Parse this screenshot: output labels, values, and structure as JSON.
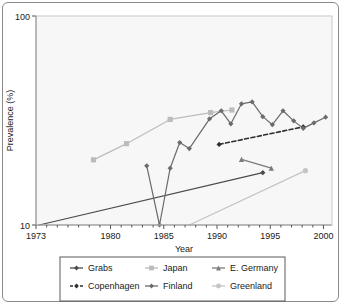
{
  "chart_data": {
    "type": "line",
    "title": "",
    "xlabel": "Year",
    "ylabel": "Prevalence (%)",
    "xlim": [
      1973,
      2000.8
    ],
    "ylim": [
      10,
      100
    ],
    "yscale": "log",
    "xscale": "linear",
    "grid": false,
    "legend_position": "bottom",
    "x_ticks": [
      1973,
      1980,
      1985,
      1990,
      1995,
      2000
    ],
    "x_tick_labels": [
      "1973",
      "1980",
      "1985",
      "1990",
      "1995",
      "2000"
    ],
    "y_ticks": [
      10,
      100
    ],
    "y_tick_labels": [
      "10",
      "100"
    ],
    "series": [
      {
        "name": "Grabs",
        "color": "#4a4a4a",
        "marker": "diamond",
        "dash": "none",
        "x": [
          1973.3,
          1994.3
        ],
        "y": [
          10.0,
          17.8
        ]
      },
      {
        "name": "Japan",
        "color": "#bcbcbc",
        "marker": "square",
        "dash": "none",
        "x": [
          1978.4,
          1981.5,
          1985.6,
          1989.4,
          1991.4
        ],
        "y": [
          20.5,
          24.5,
          32.0,
          34.5,
          35.5
        ]
      },
      {
        "name": "E. Germany",
        "color": "#7a7a7a",
        "marker": "triangle",
        "dash": "none",
        "x": [
          1992.3,
          1995.1
        ],
        "y": [
          20.6,
          18.7
        ]
      },
      {
        "name": "Copenhagen",
        "color": "#2e2e2e",
        "marker": "diamond",
        "dash": "dashed",
        "x": [
          1990.2,
          1998.1
        ],
        "y": [
          24.3,
          29.5
        ]
      },
      {
        "name": "Finland",
        "color": "#6b6b6b",
        "marker": "diamond",
        "dash": "none",
        "x": [
          1983.4,
          1984.6,
          1985.6,
          1986.5,
          1987.4,
          1989.3,
          1990.4,
          1991.3,
          1992.3,
          1993.3,
          1994.3,
          1995.2,
          1996.2,
          1997.2,
          1998.1,
          1999.1,
          2000.2
        ],
        "y": [
          19.2,
          10.0,
          18.7,
          24.8,
          23.2,
          32.2,
          35.2,
          30.5,
          38.0,
          38.8,
          33.0,
          30.2,
          35.2,
          31.5,
          29.0,
          30.8,
          32.8
        ]
      },
      {
        "name": "Greenland",
        "color": "#c4c4c4",
        "marker": "circle",
        "dash": "none",
        "x": [
          1987.4,
          1998.3
        ],
        "y": [
          10.0,
          18.2
        ]
      }
    ]
  },
  "axes": {
    "y_top_label": "100",
    "y_bottom_label": "10",
    "y_axis_title": "Prevalence (%)",
    "x_axis_title": "Year",
    "x_labels": [
      "1973",
      "1980",
      "1985",
      "1990",
      "1995",
      "2000"
    ]
  },
  "legend": {
    "entries": [
      {
        "label": "Grabs",
        "color": "#4a4a4a",
        "marker": "diamond",
        "dash": "none"
      },
      {
        "label": "Japan",
        "color": "#bcbcbc",
        "marker": "square",
        "dash": "none"
      },
      {
        "label": "E. Germany",
        "color": "#7a7a7a",
        "marker": "triangle",
        "dash": "none"
      },
      {
        "label": "Copenhagen",
        "color": "#2e2e2e",
        "marker": "diamond",
        "dash": "dashed"
      },
      {
        "label": "Finland",
        "color": "#6b6b6b",
        "marker": "diamond",
        "dash": "none"
      },
      {
        "label": "Greenland",
        "color": "#c4c4c4",
        "marker": "circle",
        "dash": "none"
      }
    ]
  }
}
